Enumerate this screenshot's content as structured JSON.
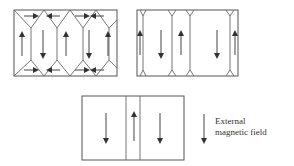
{
  "figure": {
    "panels": [
      {
        "id": "panel-1",
        "label": "Domains with closure domains, zero field",
        "domains": [
          "up",
          "down",
          "up",
          "down",
          "up"
        ],
        "closure_arrows": "alternating horizontal"
      },
      {
        "id": "panel-2",
        "label": "Domains with shrinking closure domains",
        "domains": [
          "up",
          "down",
          "up",
          "down",
          "up"
        ]
      },
      {
        "id": "panel-3",
        "label": "Down domains grow, up domain shrinks",
        "domains": [
          "down",
          "up",
          "down"
        ]
      }
    ],
    "legend": {
      "arrow_direction": "down",
      "line1": "External",
      "line2": "magnetic field"
    },
    "colors": {
      "stroke": "#555555",
      "background": "#ffffff"
    }
  }
}
